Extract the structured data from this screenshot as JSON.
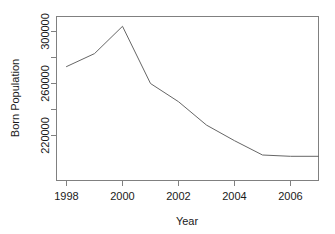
{
  "chart_data": {
    "type": "line",
    "title": "",
    "xlabel": "Year",
    "ylabel": "Born Population",
    "x": [
      1998,
      1999,
      2000,
      2001,
      2002,
      2003,
      2004,
      2005,
      2006,
      2007
    ],
    "values": [
      273000,
      283000,
      304000,
      260000,
      246000,
      228000,
      216000,
      205000,
      204000,
      204000
    ],
    "series": [
      {
        "name": "Born Population",
        "values": [
          273000,
          283000,
          304000,
          260000,
          246000,
          228000,
          216000,
          205000,
          204000,
          204000
        ]
      }
    ],
    "xlim": [
      1998,
      2007
    ],
    "ylim": [
      200000,
      312000
    ],
    "xticks": [
      1998,
      2000,
      2002,
      2004,
      2006
    ],
    "xtick_labels": [
      "1998",
      "2000",
      "2002",
      "2004",
      "2006"
    ],
    "yticks": [
      220000,
      260000,
      300000
    ],
    "ytick_labels": [
      "220000",
      "260000",
      "300000"
    ],
    "yminorticks": [
      240000,
      280000
    ],
    "grid": false,
    "legend": false,
    "line_color": "#666666"
  },
  "axis": {
    "x_title": "Year",
    "y_title": "Born Population"
  }
}
